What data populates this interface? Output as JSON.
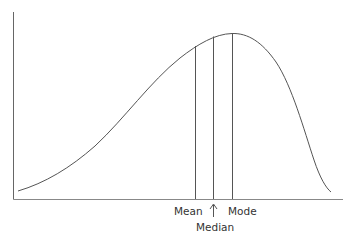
{
  "diagram": {
    "type": "skewed-distribution",
    "labels": {
      "mean": "Mean",
      "median": "Median",
      "mode": "Mode"
    },
    "colors": {
      "line": "#555555",
      "axis": "#666666",
      "text": "#333333"
    }
  }
}
